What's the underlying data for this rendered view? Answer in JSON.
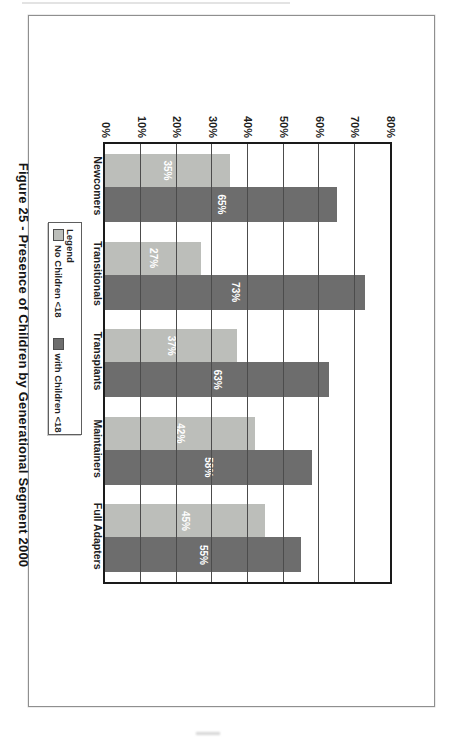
{
  "chart_data": {
    "type": "bar",
    "title": "Figure 25 - Presence of Children by Generational Segment 2000",
    "categories": [
      "Newcomers",
      "Transitionals",
      "Transplants",
      "Maintainers",
      "Full Adapters"
    ],
    "series": [
      {
        "name": "No Children <18",
        "color": "#bcbeba",
        "values": [
          35,
          27,
          37,
          42,
          45
        ]
      },
      {
        "name": "with Children <18",
        "color": "#6d6d6d",
        "values": [
          65,
          73,
          63,
          58,
          55
        ]
      }
    ],
    "value_suffix": "%",
    "value_label_color": "#ffffff",
    "yticks": [
      "0%",
      "10%",
      "20%",
      "30%",
      "40%",
      "50%",
      "60%",
      "70%",
      "80%"
    ],
    "ytick_step": 10,
    "ylim": [
      0,
      80
    ],
    "grid": true,
    "legend": {
      "title": "Legend",
      "position": "below x-axis, left"
    },
    "orientation": "landscape chart scanned rotated 90deg clockwise on portrait page"
  }
}
